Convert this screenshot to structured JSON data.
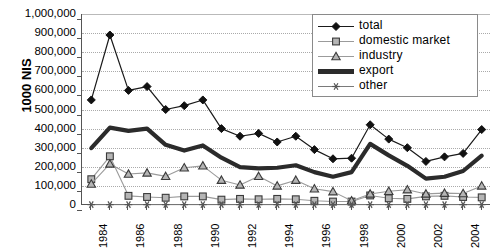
{
  "chart_data": {
    "type": "line",
    "title": "",
    "xlabel": "",
    "ylabel": "1000 NIS",
    "ylim": [
      0,
      1000000
    ],
    "ytick_labels": [
      "1,000,000",
      "900,000",
      "800,000",
      "700,000",
      "600,000",
      "500,000",
      "400,000",
      "300,000",
      "200,000",
      "100,000",
      "0"
    ],
    "ytick_values": [
      1000000,
      900000,
      800000,
      700000,
      600000,
      500000,
      400000,
      300000,
      200000,
      100000,
      0
    ],
    "grid": true,
    "legend_position": "top-right",
    "categories": [
      1984,
      1985,
      1986,
      1987,
      1988,
      1989,
      1990,
      1991,
      1992,
      1993,
      1994,
      1995,
      1996,
      1997,
      1998,
      1999,
      2000,
      2001,
      2002,
      2003,
      2004,
      2005
    ],
    "xtick_labels": [
      "1984",
      "",
      "1986",
      "",
      "1988",
      "",
      "1990",
      "",
      "1992",
      "",
      "1994",
      "",
      "1996",
      "",
      "1998",
      "",
      "2000",
      "",
      "2002",
      "",
      "2004",
      ""
    ],
    "series": [
      {
        "name": "total",
        "marker": "diamond",
        "values": [
          550000,
          890000,
          600000,
          620000,
          500000,
          520000,
          550000,
          400000,
          360000,
          375000,
          330000,
          360000,
          290000,
          242000,
          245000,
          420000,
          345000,
          300000,
          228000,
          252000,
          270000,
          395000
        ]
      },
      {
        "name": "domestic market",
        "marker": "square",
        "values": [
          135000,
          255000,
          48000,
          42000,
          38000,
          45000,
          45000,
          28000,
          32000,
          30000,
          32000,
          30000,
          22000,
          18000,
          18000,
          50000,
          35000,
          32000,
          45000,
          48000,
          42000,
          40000
        ]
      },
      {
        "name": "industry",
        "marker": "triangle",
        "values": [
          110000,
          215000,
          162000,
          168000,
          150000,
          195000,
          205000,
          130000,
          105000,
          150000,
          100000,
          130000,
          85000,
          70000,
          22000,
          58000,
          72000,
          80000,
          58000,
          62000,
          60000,
          100000
        ]
      },
      {
        "name": "export",
        "marker": "none",
        "values": [
          298000,
          405000,
          388000,
          400000,
          315000,
          285000,
          312000,
          248000,
          198000,
          192000,
          195000,
          208000,
          172000,
          148000,
          172000,
          320000,
          260000,
          205000,
          138000,
          148000,
          178000,
          258000
        ]
      },
      {
        "name": "other",
        "marker": "star",
        "values": [
          2000,
          2000,
          2000,
          2000,
          2000,
          2000,
          2000,
          2000,
          2000,
          2000,
          2000,
          2000,
          2000,
          2000,
          2000,
          2000,
          2000,
          2000,
          2000,
          2000,
          2000,
          2000
        ]
      }
    ]
  },
  "legend": {
    "items": [
      {
        "label": "total"
      },
      {
        "label": "domestic market"
      },
      {
        "label": "industry"
      },
      {
        "label": "export"
      },
      {
        "label": "other"
      }
    ]
  },
  "colors": {
    "total": "#1a1a1a",
    "domestic_market": "#8c8c8c",
    "industry": "#9a9a9a",
    "export": "#2b2b2b",
    "other": "#6e6e6e",
    "grid": "#aaaaaa",
    "axis": "#555555",
    "background": "#ffffff"
  }
}
